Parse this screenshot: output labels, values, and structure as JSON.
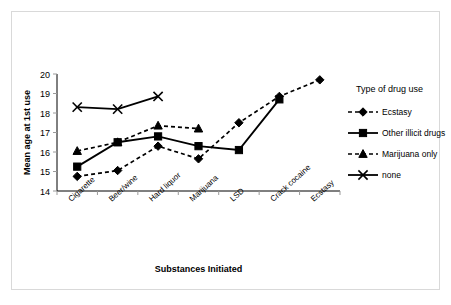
{
  "chart_data": {
    "type": "line",
    "title": "",
    "xlabel": "Substances Initiated",
    "ylabel": "Mean age at 1st use",
    "categories": [
      "Cigarette",
      "Beer/wine",
      "Hard liquor",
      "Marijuana",
      "LSD",
      "Crack cocaine",
      "Ecstasy"
    ],
    "ylim": [
      14,
      20
    ],
    "yticks": [
      "14",
      "15",
      "16",
      "17",
      "18",
      "19",
      "20"
    ],
    "grid": false,
    "legend_position": "right",
    "legend_title": "Type of drug use",
    "series": [
      {
        "name": "Ecstasy",
        "marker": "diamond",
        "linestyle": "dashed",
        "values": [
          14.75,
          15.05,
          16.3,
          15.65,
          17.5,
          18.85,
          19.7
        ]
      },
      {
        "name": "Other illicit drugs",
        "marker": "square",
        "linestyle": "solid",
        "values": [
          15.25,
          16.5,
          16.8,
          16.3,
          16.1,
          18.7,
          null
        ]
      },
      {
        "name": "Marijuana only",
        "marker": "triangle",
        "linestyle": "dashed",
        "values": [
          16.05,
          16.5,
          17.35,
          17.2,
          null,
          null,
          null
        ]
      },
      {
        "name": "none",
        "marker": "cross",
        "linestyle": "solid",
        "values": [
          18.3,
          18.2,
          18.85,
          null,
          null,
          null,
          null
        ]
      }
    ]
  }
}
